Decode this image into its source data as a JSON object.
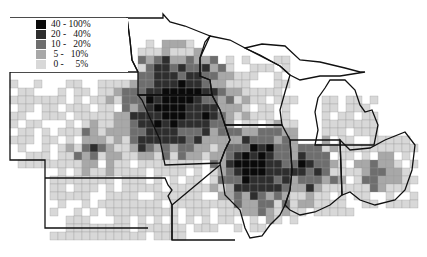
{
  "map": {
    "type": "choropleth",
    "region": "US Midwest (MN, WI, MI, IA, IL, IN, OH, MO, NE, KS, SD)",
    "unit": "county",
    "colors": [
      "#d8d8d8",
      "#a8a8a8",
      "#6e6e6e",
      "#2e2e2e",
      "#0a0a0a"
    ]
  },
  "legend": {
    "items": [
      {
        "label": "40 - 100%",
        "color": "#0a0a0a"
      },
      {
        "label": "20 -   40%",
        "color": "#2e2e2e"
      },
      {
        "label": "10 -   20%",
        "color": "#6e6e6e"
      },
      {
        "label": " 5 -   10%",
        "color": "#a8a8a8"
      },
      {
        "label": " 0 -     5%",
        "color": "#d8d8d8"
      }
    ]
  }
}
